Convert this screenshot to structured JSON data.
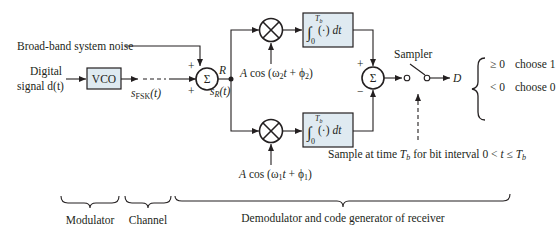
{
  "diagram": {
    "type": "block-diagram",
    "topic": "FSK coherent receiver system",
    "inputs": {
      "digital_signal_line1": "Digital",
      "digital_signal_line2": "signal d(t)",
      "noise_label": "Broad-band system noise"
    },
    "blocks": {
      "vco": "VCO",
      "sum_symbol": "Σ",
      "integrator_upper": "∫₀^{T_b} (·) dt",
      "integrator_lower": "∫₀^{T_b} (·) dt"
    },
    "signals": {
      "s_fsk": "s",
      "s_fsk_sub": "FSK",
      "s_fsk_arg": "(t)",
      "r_label": "R",
      "s_r": "s",
      "s_r_sub": "R",
      "s_r_arg": "(t)",
      "carrier_upper": "A cos (ω₂t + ϕ₂)",
      "carrier_lower": "A cos (ω₁t + ϕ₁)",
      "output_D": "D"
    },
    "signs": {
      "plus": "+",
      "minus": "−"
    },
    "sampler": {
      "label": "Sampler",
      "note": "Sample at time T_b for bit interval 0 < t ≤ T_b"
    },
    "decision": {
      "rule1_cond": "≥ 0",
      "rule1_action": "choose 1",
      "rule2_cond": "< 0",
      "rule2_action": "choose 0"
    },
    "sections": [
      {
        "label": "Modulator"
      },
      {
        "label": "Channel"
      },
      {
        "label": "Demodulator and code generator of receiver"
      }
    ]
  }
}
